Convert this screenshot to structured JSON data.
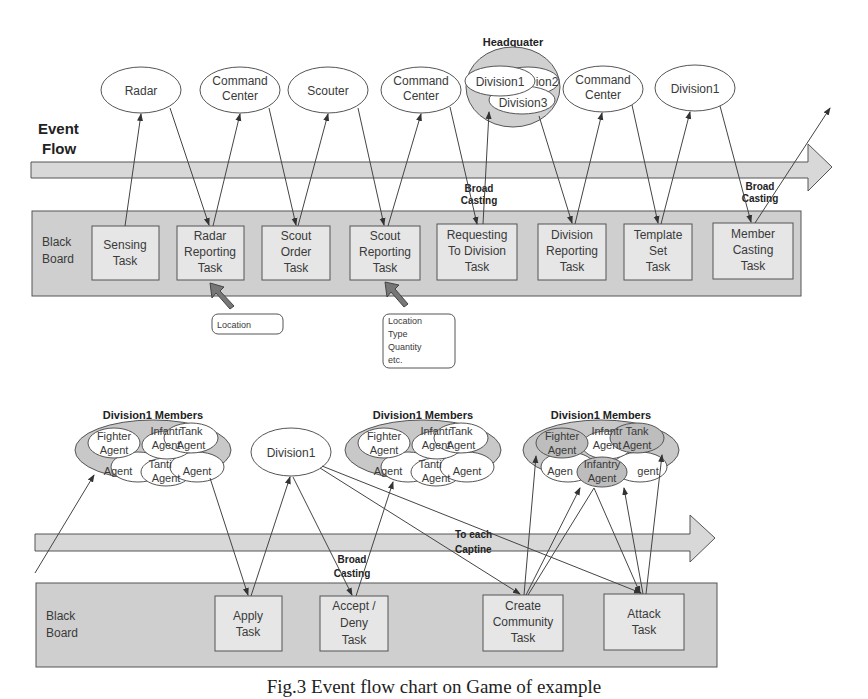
{
  "event_flow": {
    "line1": "Event",
    "line2": "Flow"
  },
  "top": {
    "nodes": [
      {
        "l1": "Radar",
        "l2": ""
      },
      {
        "l1": "Command",
        "l2": "Center"
      },
      {
        "l1": "Scouter",
        "l2": ""
      },
      {
        "l1": "Command",
        "l2": "Center"
      },
      {
        "l1": "Command",
        "l2": "Center"
      },
      {
        "l1": "Division1",
        "l2": ""
      }
    ],
    "headquarter": {
      "title1": "Headquater",
      "title2": "Members",
      "members": [
        "Division1",
        "Division2",
        "Division3"
      ],
      "visible": [
        "Division1",
        "ion2",
        "Division3"
      ]
    },
    "blackboard": {
      "l1": "Black",
      "l2": "Board"
    },
    "tasks": [
      {
        "l1": "Sensing",
        "l2": "Task",
        "l3": ""
      },
      {
        "l1": "Radar",
        "l2": "Reporting",
        "l3": "Task"
      },
      {
        "l1": "Scout",
        "l2": "Order",
        "l3": "Task"
      },
      {
        "l1": "Scout",
        "l2": "Reporting",
        "l3": "Task"
      },
      {
        "l1": "Requesting",
        "l2": "To Division",
        "l3": "Task"
      },
      {
        "l1": "Division",
        "l2": "Reporting",
        "l3": "Task"
      },
      {
        "l1": "Template",
        "l2": "Set",
        "l3": "Task"
      },
      {
        "l1": "Member",
        "l2": "Casting",
        "l3": "Task"
      }
    ],
    "broadcasting_labels": [
      {
        "l1": "Broad",
        "l2": "Casting"
      },
      {
        "l1": "Broad",
        "l2": "Casting"
      }
    ],
    "notes": [
      {
        "lines": [
          "Location"
        ]
      },
      {
        "lines": [
          "Location",
          "Type",
          "Quantity",
          "etc."
        ]
      }
    ]
  },
  "bottom": {
    "groups": [
      {
        "title": "Division1 Members",
        "agents": [
          "Fighter Agent",
          "Infantry Agent",
          "Tank Agent",
          "Fighter Agent",
          "Infantry Agent",
          "Tank Agent"
        ]
      },
      {
        "title": "Division1 Members",
        "agents": [
          "Fighter Agent",
          "Infantry Agent",
          "Tank Agent",
          "Fighter Agent",
          "Infantry Agent",
          "Tank Agent"
        ]
      },
      {
        "title": "Division1 Members",
        "agents": [
          "Fighter Agent",
          "Infantry Agent",
          "Tank Agent",
          "Fighter Agent",
          "Infantry Agent",
          "Tank Agent"
        ],
        "highlighted": [
          "Fighter Agent",
          "Tank Agent",
          "Infantry Agent"
        ]
      }
    ],
    "agent_words": {
      "fighter": "Fighter",
      "infantry": "Infantry",
      "infantr": "Infantr",
      "tank": "Tank",
      "agent": "Agent",
      "tanti": "Tanti",
      "agen": "Agen",
      "gent": "gent"
    },
    "division_node": "Division1",
    "broadcasting_label": {
      "l1": "Broad",
      "l2": "Casting"
    },
    "to_each_label": {
      "l1": "To each",
      "l2": "Captine"
    },
    "blackboard": {
      "l1": "Black",
      "l2": "Board"
    },
    "tasks": [
      {
        "l1": "Apply",
        "l2": "Task",
        "l3": ""
      },
      {
        "l1": "Accept /",
        "l2": "Deny",
        "l3": "Task"
      },
      {
        "l1": "Create",
        "l2": "Community",
        "l3": "Task"
      },
      {
        "l1": "Attack",
        "l2": "Task",
        "l3": ""
      }
    ]
  },
  "colors": {
    "band": "#d8d8d8",
    "blackboard": "#cfcfcf",
    "task": "#e6e6e6",
    "line": "#444444",
    "group": "#c8c8c8",
    "highlight": "#bdbdbd"
  },
  "caption": "Fig.3 Event flow chart on Game of example"
}
